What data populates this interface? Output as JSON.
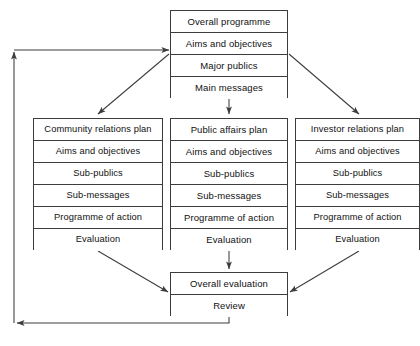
{
  "diagram": {
    "line_color": "#3c3c3c",
    "text_color": "#111111",
    "background": "#ffffff"
  },
  "top_box": {
    "name": "overall-programme-box",
    "rows": [
      "Overall programme",
      "Aims and objectives",
      "Major publics",
      "Main messages"
    ]
  },
  "columns": [
    {
      "name": "community-relations-plan",
      "rows": [
        "Community relations plan",
        "Aims and objectives",
        "Sub-publics",
        "Sub-messages",
        "Programme of action",
        "Evaluation"
      ]
    },
    {
      "name": "public-affairs-plan",
      "rows": [
        "Public affairs plan",
        "Aims and objectives",
        "Sub-publics",
        "Sub-messages",
        "Programme of action",
        "Evaluation"
      ]
    },
    {
      "name": "investor-relations-plan",
      "rows": [
        "Investor relations plan",
        "Aims and objectives",
        "Sub-publics",
        "Sub-messages",
        "Programme of action",
        "Evaluation"
      ]
    }
  ],
  "bottom_box": {
    "name": "overall-evaluation-box",
    "rows": [
      "Overall evaluation",
      "Review"
    ]
  },
  "connectors": [
    {
      "name": "top-to-community-arrow",
      "type": "diagonal-down-left"
    },
    {
      "name": "top-to-public-arrow",
      "type": "vertical-down"
    },
    {
      "name": "top-to-investor-arrow",
      "type": "diagonal-down-right"
    },
    {
      "name": "community-to-evaluation-arrow",
      "type": "diagonal-down-right"
    },
    {
      "name": "public-to-evaluation-arrow",
      "type": "vertical-down"
    },
    {
      "name": "investor-to-evaluation-arrow",
      "type": "diagonal-down-left"
    },
    {
      "name": "feedback-loop-arrow",
      "type": "feedback-left-up-right"
    }
  ]
}
